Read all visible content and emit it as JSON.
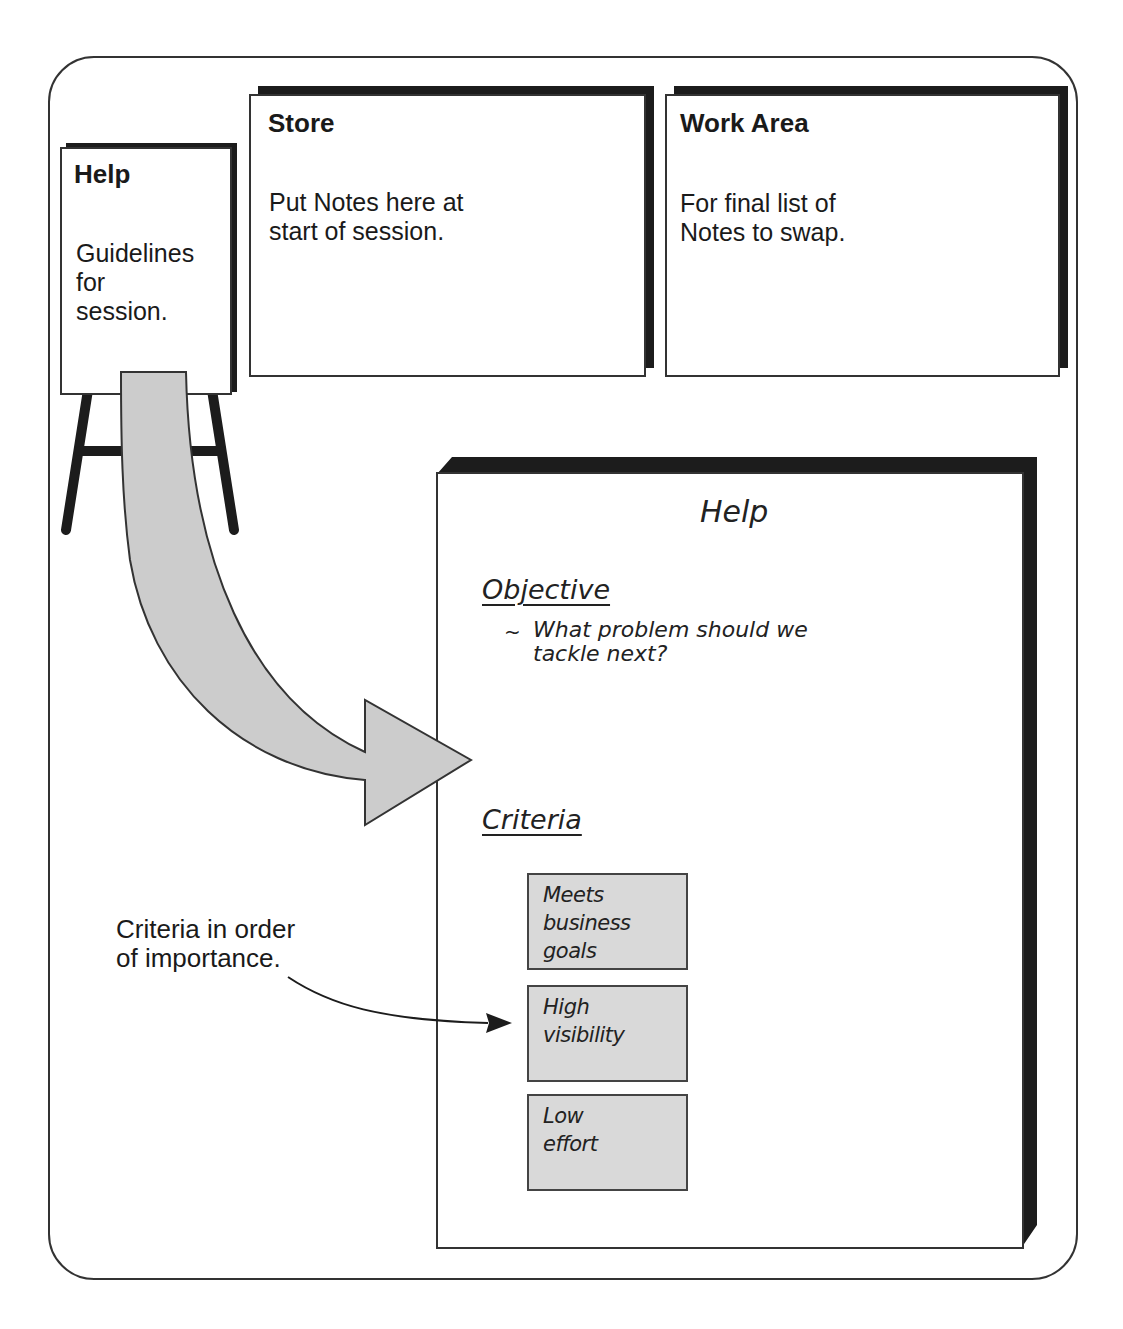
{
  "panels": {
    "help_easel": {
      "title": "Help",
      "body": "Guidelines\nfor\nsession."
    },
    "store": {
      "title": "Store",
      "body": "Put Notes here at\nstart of session."
    },
    "work_area": {
      "title": "Work Area",
      "body": "For final list of\nNotes to swap."
    }
  },
  "help_board": {
    "title": "Help",
    "objective": {
      "heading": "Objective",
      "bullet_marker": "~",
      "text": "What problem should we\ntackle next?"
    },
    "criteria": {
      "heading": "Criteria",
      "items": [
        "Meets\nbusiness goals",
        "High\nvisibility",
        "Low\neffort"
      ]
    }
  },
  "annotation": {
    "text": "Criteria in order\nof importance."
  },
  "colors": {
    "outline": "#333333",
    "shadow": "#1c1c1c",
    "arrow_fill": "#cccccc",
    "note_fill": "#d9d9d9"
  }
}
